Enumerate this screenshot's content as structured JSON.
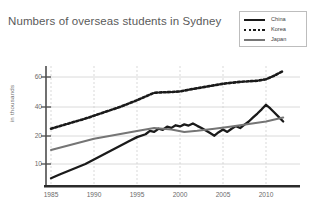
{
  "chart": {
    "title": "Numbers of overseas students in Sydney",
    "ylabel": "in thousands"
  },
  "legend": {
    "items": [
      {
        "label": "China",
        "style": "solid-black",
        "color": "#1a1a1a"
      },
      {
        "label": "Korea",
        "style": "dotted-black",
        "color": "#1a1a1a"
      },
      {
        "label": "Japan",
        "style": "solid-gray",
        "color": "#757575"
      }
    ]
  },
  "axes": {
    "y_ticks": [
      "60",
      "40",
      "20",
      "10"
    ],
    "x_ticks": [
      "1985",
      "1990",
      "1995",
      "2000",
      "2005",
      "2010"
    ]
  },
  "chart_data": {
    "type": "line",
    "title": "Numbers of overseas students in Sydney",
    "xlabel": "",
    "ylabel": "in thousands",
    "xlim": [
      1985,
      2012
    ],
    "ylim": [
      0,
      65
    ],
    "yticks": [
      10,
      20,
      40,
      60
    ],
    "xticks": [
      1985,
      1990,
      1995,
      2000,
      2005,
      2010
    ],
    "grid": true,
    "legend_position": "top-right",
    "series": [
      {
        "name": "China",
        "color": "#1a1a1a",
        "style": "solid",
        "x": [
          1985,
          1986,
          1987,
          1988,
          1989,
          1990,
          1991,
          1992,
          1993,
          1994,
          1995,
          1996,
          1996.5,
          1997,
          1997.5,
          1998,
          1998.5,
          1999,
          1999.5,
          2000,
          2000.5,
          2001,
          2001.5,
          2002,
          2002.5,
          2003,
          2003.5,
          2004,
          2004.5,
          2005,
          2005.5,
          2006,
          2006.5,
          2007,
          2007.5,
          2008,
          2008.5,
          2009,
          2009.5,
          2010,
          2010.5,
          2011,
          2011.5,
          2012
        ],
        "values": [
          3.5,
          5.2,
          6.8,
          8.4,
          10.0,
          11.6,
          13.2,
          14.8,
          16.4,
          18.0,
          19.6,
          21.2,
          23.5,
          22.8,
          25.0,
          24.3,
          26.4,
          25.6,
          27.4,
          26.6,
          28.0,
          27.2,
          28.6,
          27.0,
          25.5,
          23.8,
          22.0,
          20.2,
          22.6,
          24.5,
          22.8,
          25.0,
          26.8,
          25.5,
          27.8,
          30.0,
          32.8,
          35.5,
          38.4,
          41.5,
          39.0,
          36.0,
          33.0,
          30.0
        ]
      },
      {
        "name": "Korea",
        "color": "#1a1a1a",
        "style": "dotted",
        "x": [
          1985,
          1987,
          1989,
          1991,
          1993,
          1995,
          1997,
          1998,
          1999,
          2000,
          2001,
          2003,
          2005,
          2007,
          2009,
          2010,
          2011,
          2012
        ],
        "values": [
          25.0,
          28.5,
          32.0,
          36.0,
          40.0,
          44.5,
          49.5,
          49.8,
          50.0,
          50.4,
          51.5,
          53.5,
          55.5,
          56.8,
          57.5,
          58.5,
          60.5,
          62.0
        ]
      },
      {
        "name": "Japan",
        "color": "#757575",
        "style": "solid",
        "x": [
          1985,
          1990,
          1995,
          1997,
          1999,
          2000.5,
          2002,
          2004,
          2006,
          2008,
          2010,
          2012
        ],
        "values": [
          15.0,
          19.0,
          23.5,
          25.5,
          24.5,
          22.8,
          23.6,
          25.0,
          26.6,
          28.2,
          30.0,
          32.8
        ]
      }
    ]
  }
}
